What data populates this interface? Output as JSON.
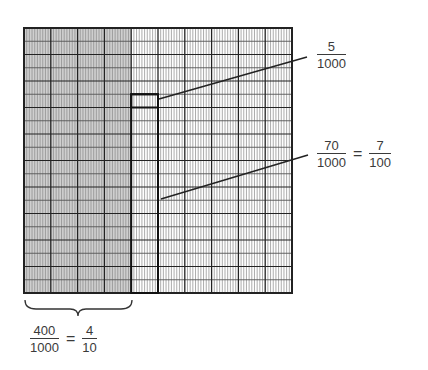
{
  "diagram": {
    "grid": {
      "columns": 100,
      "rows": 20,
      "major_column_every": 10,
      "major_row_every": 2,
      "shaded_columns": 40,
      "shade_color": "#cfcfcf",
      "line_color": "#555555",
      "border_color": "#222222"
    },
    "highlights": [
      {
        "name": "five-thousandths-box",
        "col_start": 40,
        "col_span": 10,
        "row_start": 5,
        "row_span": 1
      },
      {
        "name": "seventy-thousandths-column",
        "col_start": 40,
        "col_span": 10,
        "row_start": 5,
        "row_span": 15
      }
    ],
    "labels": {
      "five": {
        "numerator": "5",
        "denominator": "1000"
      },
      "seventy": {
        "numerator": "70",
        "denominator": "1000",
        "equals": "=",
        "eq_numerator": "7",
        "eq_denominator": "100"
      },
      "four_hundred": {
        "numerator": "400",
        "denominator": "1000",
        "equals": "=",
        "eq_numerator": "4",
        "eq_denominator": "10"
      }
    }
  }
}
